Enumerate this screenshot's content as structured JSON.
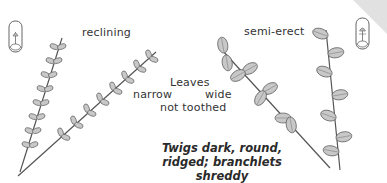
{
  "illustration": {
    "labels": {
      "reclining": "reclining",
      "semi_erect": "semi-erect",
      "leaves": "Leaves",
      "narrow": "narrow",
      "wide": "wide",
      "not_toothed": "not toothed"
    },
    "caption": {
      "line1": "Twigs dark, round,",
      "line2": "ridged; branchlets shreddy"
    },
    "icons": [
      "habit-vial-icon-left",
      "habit-vial-icon-right"
    ],
    "colors": {
      "leaf_fill": "#c8c8c8",
      "stroke": "#555555",
      "text": "#2a2a2a"
    }
  }
}
